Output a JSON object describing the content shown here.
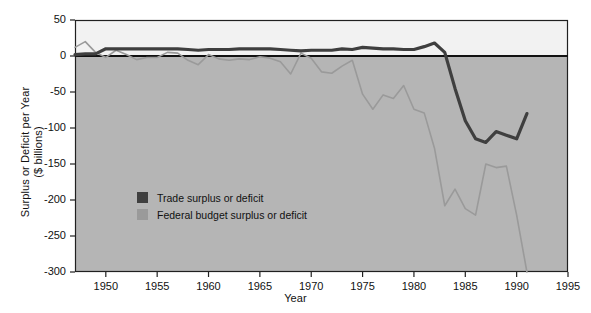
{
  "chart_data": {
    "type": "line",
    "title": "",
    "xlabel": "Year",
    "ylabel": "Surplus or Deficit per Year ($ billions)",
    "ylabel_line1": "Surplus or Deficit per Year",
    "ylabel_line2": "($ billions)",
    "xlim": [
      1947,
      1995
    ],
    "ylim": [
      -300,
      50
    ],
    "xticks": [
      1950,
      1955,
      1960,
      1965,
      1970,
      1975,
      1980,
      1985,
      1990,
      1995
    ],
    "xtick_labels": [
      "1950",
      "1955",
      "1960",
      "1965",
      "1970",
      "1975",
      "1980",
      "1985",
      "1990",
      "1995"
    ],
    "yticks": [
      50,
      0,
      -50,
      -100,
      -150,
      -200,
      -250,
      -300
    ],
    "ytick_labels": [
      "50",
      "0",
      "-50",
      "-100",
      "-150",
      "-200",
      "-250",
      "-300"
    ],
    "grid": false,
    "legend_position": "inner-lower-left",
    "zero_line": 0,
    "colors": {
      "trade": "#3f3f3f",
      "budget": "#9a9a9a",
      "plot_above_zero": "#f2f2f2",
      "plot_below_zero": "#b5b5b5",
      "axis": "#202020",
      "page_background": "#ffffff"
    },
    "series": [
      {
        "name": "Trade surplus or deficit",
        "color": "#3f3f3f",
        "x": [
          1947,
          1948,
          1949,
          1950,
          1951,
          1952,
          1953,
          1954,
          1955,
          1956,
          1957,
          1958,
          1959,
          1960,
          1961,
          1962,
          1963,
          1964,
          1965,
          1966,
          1967,
          1968,
          1969,
          1970,
          1971,
          1972,
          1973,
          1974,
          1975,
          1976,
          1977,
          1978,
          1979,
          1980,
          1981,
          1982,
          1983,
          1984,
          1985,
          1986,
          1987,
          1988,
          1989,
          1990,
          1991
        ],
        "y": [
          2,
          3,
          3,
          10,
          10,
          10,
          10,
          10,
          10,
          10,
          10,
          9,
          8,
          9,
          9,
          9,
          10,
          10,
          10,
          10,
          9,
          8,
          7,
          8,
          8,
          8,
          10,
          9,
          12,
          11,
          10,
          10,
          9,
          9,
          13,
          18,
          5,
          -45,
          -90,
          -115,
          -120,
          -105,
          -110,
          -115,
          -80
        ]
      },
      {
        "name": "Federal budget surplus or deficit",
        "color": "#9a9a9a",
        "x": [
          1947,
          1948,
          1949,
          1950,
          1951,
          1952,
          1953,
          1954,
          1955,
          1956,
          1957,
          1958,
          1959,
          1960,
          1961,
          1962,
          1963,
          1964,
          1965,
          1966,
          1967,
          1968,
          1969,
          1970,
          1971,
          1972,
          1973,
          1974,
          1975,
          1976,
          1977,
          1978,
          1979,
          1980,
          1981,
          1982,
          1983,
          1984,
          1985,
          1986,
          1987,
          1988,
          1989,
          1990,
          1991
        ],
        "y": [
          12,
          20,
          5,
          -2,
          8,
          2,
          -5,
          -2,
          -2,
          5,
          4,
          -6,
          -12,
          2,
          -4,
          -6,
          -4,
          -5,
          -1,
          -3,
          -8,
          -25,
          4,
          -3,
          -22,
          -24,
          -14,
          -6,
          -53,
          -74,
          -54,
          -59,
          -41,
          -74,
          -79,
          -128,
          -208,
          -185,
          -212,
          -221,
          -150,
          -155,
          -153,
          -221,
          -300
        ]
      }
    ]
  },
  "legend": {
    "items": [
      {
        "label": "Trade surplus or deficit",
        "color": "#3f3f3f"
      },
      {
        "label": "Federal budget surplus or deficit",
        "color": "#9a9a9a"
      }
    ]
  }
}
